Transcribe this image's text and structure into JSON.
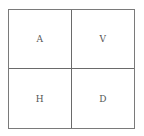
{
  "diagram": {
    "type": "2x2 grid",
    "cells": [
      {
        "label": "A",
        "position": "top-left"
      },
      {
        "label": "V",
        "position": "top-right"
      },
      {
        "label": "H",
        "position": "bottom-left"
      },
      {
        "label": "D",
        "position": "bottom-right"
      }
    ]
  }
}
